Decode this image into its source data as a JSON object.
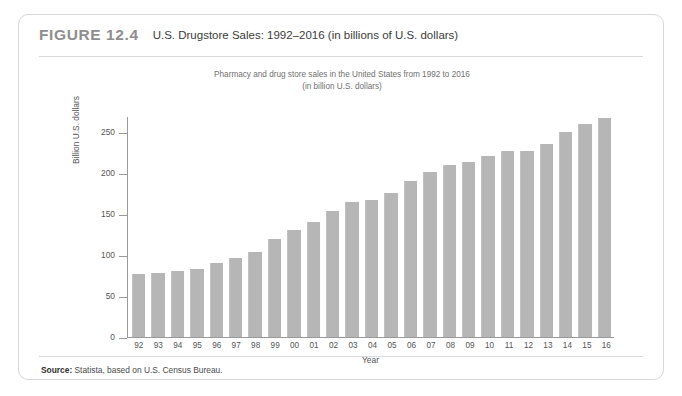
{
  "figure": {
    "number": "FIGURE 12.4",
    "title": "U.S. Drugstore Sales: 1992–2016 (in billions of U.S. dollars)",
    "source_label": "Source:",
    "source_text": " Statista, based on U.S. Census Bureau."
  },
  "chart_data": {
    "type": "bar",
    "title": "Pharmacy and drug store sales in the United States from 1992 to 2016",
    "subtitle": "(in billion U.S. dollars)",
    "xlabel": "Year",
    "ylabel": "Billion U.S. dollars",
    "ylim": [
      0,
      270
    ],
    "yticks": [
      0,
      50,
      100,
      150,
      200,
      250
    ],
    "ytick_labels": [
      "0",
      "50",
      "100",
      "150",
      "200",
      "250"
    ],
    "grid": false,
    "legend": false,
    "bar_color": "#b6b6b6",
    "categories": [
      "92",
      "93",
      "94",
      "95",
      "96",
      "97",
      "98",
      "99",
      "00",
      "01",
      "02",
      "03",
      "04",
      "05",
      "06",
      "07",
      "08",
      "09",
      "10",
      "11",
      "12",
      "13",
      "14",
      "15",
      "16"
    ],
    "values": [
      77,
      78,
      81,
      83,
      90,
      97,
      104,
      120,
      131,
      141,
      154,
      165,
      168,
      176,
      190,
      201,
      210,
      214,
      221,
      227,
      227,
      236,
      251,
      260,
      268
    ]
  }
}
